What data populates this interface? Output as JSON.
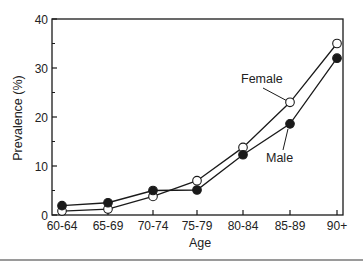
{
  "chart_data": {
    "type": "line",
    "title": "",
    "xlabel": "Age",
    "ylabel": "Prevalence (%)",
    "categories": [
      "60-64",
      "65-69",
      "70-74",
      "75-79",
      "80-84",
      "85-89",
      "90+"
    ],
    "ylim": [
      0,
      40
    ],
    "yticks": [
      0,
      10,
      20,
      30,
      40
    ],
    "grid": false,
    "legend": "inline annotations",
    "series": [
      {
        "name": "Female",
        "marker": "open-circle",
        "values": [
          0.8,
          1.2,
          3.8,
          7.0,
          13.8,
          23.0,
          35.0
        ]
      },
      {
        "name": "Male",
        "marker": "filled-circle",
        "values": [
          1.9,
          2.5,
          5.0,
          5.1,
          12.3,
          18.6,
          32.0
        ]
      }
    ],
    "annotations": [
      {
        "text": "Female",
        "points_to": "Female 85-89"
      },
      {
        "text": "Male",
        "points_to": "Male 85-89"
      }
    ]
  },
  "colors": {
    "line": "#1a1a1a",
    "axis": "#1a1a1a",
    "open_marker_fill": "#ffffff"
  }
}
